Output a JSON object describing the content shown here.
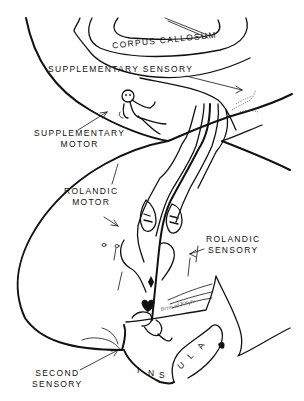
{
  "diagram": {
    "type": "anatomical line drawing",
    "colors": {
      "ink": "#111111",
      "background": "#ffffff"
    },
    "labels": {
      "corpus_callosum": "CORPUS CALLOSUM",
      "supplementary_sensory": "SUPPLEMENTARY SENSORY",
      "supplementary_motor_line1": "SUPPLEMENTARY",
      "supplementary_motor_line2": "MOTOR",
      "rolandic_motor_line1": "ROLANDIC",
      "rolandic_motor_line2": "MOTOR",
      "rolandic_sensory_line1": "ROLANDIC",
      "rolandic_sensory_line2": "SENSORY",
      "second_sensory_line1": "SECOND",
      "second_sensory_line2": "SENSORY",
      "insula": [
        "I",
        "N",
        "S",
        "U",
        "L",
        "A"
      ],
      "handwritten_note": "Brim of F.Sylv"
    },
    "arrows": [
      {
        "from": "supplementary_sensory",
        "to": "dotted-figure-right"
      },
      {
        "from": "supplementary_motor",
        "to": "homunculus-figure"
      },
      {
        "from": "rolandic_motor",
        "to": "precentral-gyrus"
      },
      {
        "from": "rolandic_sensory",
        "to": "postcentral-gyrus"
      },
      {
        "from": "second_sensory",
        "to": "sylvian-region"
      }
    ]
  }
}
